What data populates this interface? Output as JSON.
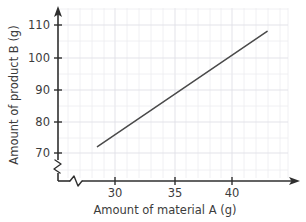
{
  "chart_data": {
    "type": "line",
    "title": "",
    "xlabel": "Amount of material A (g)",
    "ylabel": "Amount of product B (g)",
    "xlim": [
      26.0,
      44.8
    ],
    "ylim": [
      66.5,
      112.5
    ],
    "xticks": [
      30,
      35,
      40
    ],
    "yticks": [
      70,
      80,
      90,
      100,
      110
    ],
    "xtick_labels": [
      "30",
      "35",
      "40"
    ],
    "ytick_labels": [
      "70",
      "80",
      "90",
      "100",
      "110"
    ],
    "grid": true,
    "grid_minor": true,
    "legend": false,
    "axis_break_x": true,
    "axis_break_y": true,
    "series": [
      {
        "name": "product B vs material A",
        "x": [
          28.5,
          43.0
        ],
        "values": [
          72.0,
          108.0
        ],
        "color": "#4a4a4a"
      }
    ],
    "annotations": []
  },
  "colors": {
    "background": "#ffffff",
    "axis": "#2f2f2f",
    "grid_minor": "#ececf0",
    "grid_major": "#e0e0e6",
    "line": "#4a4a4a",
    "text": "#3c3c3c"
  },
  "ytick_label_0": "110",
  "ytick_label_1": "100",
  "ytick_label_2": "90",
  "ytick_label_3": "80",
  "ytick_label_4": "70",
  "xtick_label_0": "30",
  "xtick_label_1": "35",
  "xtick_label_2": "40"
}
